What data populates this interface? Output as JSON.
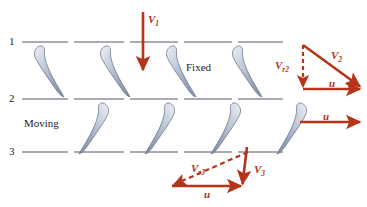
{
  "diagram": {
    "colors": {
      "vector": "#b5351a",
      "station_line": "#8d9099",
      "blade_fill_light": "#e9edf3",
      "blade_fill_mid": "#9aa8bd",
      "blade_edge": "#5d6b80",
      "text": "#1b1b1b",
      "background": "#ffffff"
    },
    "stations": [
      {
        "name": "station-1",
        "label": "1",
        "x": 10,
        "y": 36,
        "line_y": 42,
        "line_x1": 22,
        "line_x2": 283
      },
      {
        "name": "station-2",
        "label": "2",
        "x": 10,
        "y": 93,
        "line_y": 99,
        "line_x1": 22,
        "line_x2": 283
      },
      {
        "name": "station-3",
        "label": "3",
        "x": 10,
        "y": 146,
        "line_y": 152,
        "line_x1": 22,
        "line_x2": 283
      }
    ],
    "regions": [
      {
        "name": "fixed-row-label",
        "label": "Fixed",
        "x": 186,
        "y": 62
      },
      {
        "name": "moving-row-label",
        "label": "Moving",
        "x": 24,
        "y": 118
      }
    ],
    "blade_rows": [
      {
        "name": "fixed-blade-row",
        "row_label": "Fixed",
        "orientation": "leading-edge-top-left",
        "count": 4,
        "bulb_x": [
          40,
          106,
          172,
          238
        ],
        "top_y": 46,
        "bottom_y": 97
      },
      {
        "name": "moving-blade-row",
        "row_label": "Moving",
        "orientation": "leading-edge-top-right",
        "count": 4,
        "bulb_x": [
          103,
          169,
          235,
          301
        ],
        "top_y": 103,
        "bottom_y": 153
      }
    ],
    "vectors": [
      {
        "name": "v1-inlet-velocity",
        "label": "V",
        "subscript": "1",
        "style": "solid",
        "x1": 143,
        "y1": 12,
        "x2": 143,
        "y2": 72,
        "label_x": 148,
        "label_y": 14
      },
      {
        "name": "vr2-relative-velocity",
        "label": "V",
        "subscript": "r2",
        "style": "dashed",
        "x1": 303,
        "y1": 45,
        "x2": 303,
        "y2": 89,
        "label_x": 275,
        "label_y": 60
      },
      {
        "name": "v2-absolute-velocity",
        "label": "V",
        "subscript": "2",
        "style": "solid",
        "x1": 303,
        "y1": 45,
        "x2": 362,
        "y2": 88,
        "label_x": 331,
        "label_y": 50
      },
      {
        "name": "u-blade-speed-upper",
        "label": "u",
        "subscript": "",
        "style": "solid",
        "x1": 303,
        "y1": 89,
        "x2": 363,
        "y2": 89,
        "label_x": 329,
        "label_y": 78
      },
      {
        "name": "u-blade-speed-middle",
        "label": "u",
        "subscript": "",
        "style": "solid",
        "x1": 300,
        "y1": 122,
        "x2": 362,
        "y2": 122,
        "label_x": 323,
        "label_y": 111
      },
      {
        "name": "vr3-relative-velocity",
        "label": "V",
        "subscript": "r3",
        "style": "dashed",
        "x1": 248,
        "y1": 152,
        "x2": 171,
        "y2": 186,
        "label_x": 191,
        "label_y": 163
      },
      {
        "name": "v3-absolute-velocity",
        "label": "V",
        "subscript": "3",
        "style": "solid",
        "x1": 247,
        "y1": 147,
        "x2": 242,
        "y2": 187,
        "label_x": 254,
        "label_y": 164
      },
      {
        "name": "u-blade-speed-lower",
        "label": "u",
        "subscript": "",
        "style": "solid",
        "x1": 172,
        "y1": 186,
        "x2": 244,
        "y2": 186,
        "label_x": 204,
        "label_y": 190
      }
    ]
  }
}
